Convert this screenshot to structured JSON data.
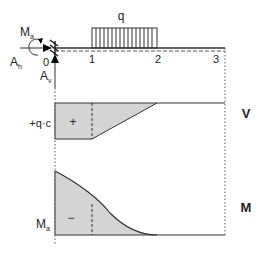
{
  "beam": {
    "load_label": "q",
    "moment_label": "M",
    "moment_sub": "a",
    "horizontal_reaction_label": "A",
    "horizontal_reaction_sub": "h",
    "vertical_reaction_label": "A",
    "vertical_reaction_sub": "v",
    "axis_ticks": [
      "0",
      "1",
      "2",
      "3"
    ]
  },
  "shear_diagram": {
    "title": "V",
    "value_label": "+q·c",
    "sign": "+"
  },
  "moment_diagram": {
    "title": "M",
    "value_label": "M",
    "value_sub": "a",
    "sign": "−"
  },
  "colors": {
    "line": "#333333",
    "fill": "#d4d4d4",
    "dashed": "#555555"
  }
}
